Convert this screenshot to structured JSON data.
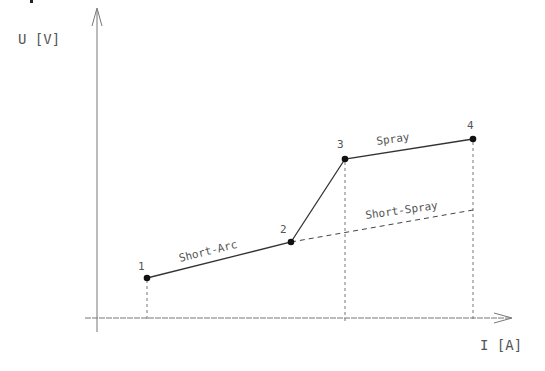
{
  "diagram": {
    "y_axis_label": "U [V]",
    "x_axis_label": "I [A]",
    "points": [
      {
        "id": "1",
        "x": 147,
        "y": 278
      },
      {
        "id": "2",
        "x": 291,
        "y": 242
      },
      {
        "id": "3",
        "x": 345,
        "y": 159
      },
      {
        "id": "4",
        "x": 473,
        "y": 139
      }
    ],
    "segments": [
      {
        "label": "Short-Arc",
        "from": "1",
        "to": "2",
        "style": "solid"
      },
      {
        "label": "",
        "from": "2",
        "to": "3",
        "style": "solid"
      },
      {
        "label": "Spray",
        "from": "3",
        "to": "4",
        "style": "solid"
      },
      {
        "label": "Short-Spray",
        "from": "2",
        "to": "end",
        "style": "dashed"
      }
    ],
    "colors": {
      "line": "#333333",
      "axis": "#777777",
      "text": "#555555",
      "point": "#111111"
    }
  }
}
